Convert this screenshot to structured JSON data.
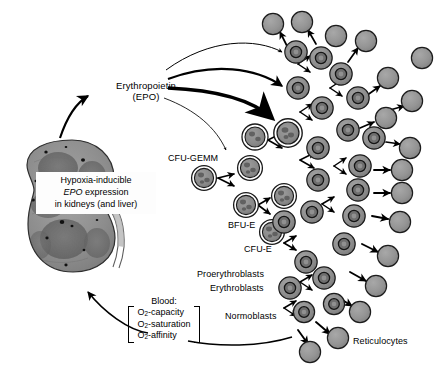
{
  "figure": {
    "labels": {
      "epo_line1": "Erythropoietin",
      "epo_line2": "(EPO)",
      "cfu_gemm": "CFU-GEMM",
      "bfu_e": "BFU-E",
      "cfu_e": "CFU-E",
      "proerythroblasts": "Proerythroblasts",
      "erythroblasts": "Erythroblasts",
      "normoblasts": "Normoblasts",
      "reticulocytes": "Reticulocytes"
    },
    "kidney_box": {
      "line1": "Hypoxia-inducible",
      "line2_italic": "EPO",
      "line2_rest": " expression",
      "line3": "in kidneys (and liver)"
    },
    "blood_box": {
      "title": "Blood:",
      "item1_pre": "O",
      "item1_sub": "2",
      "item1_post": "-capacity",
      "item2_pre": "O",
      "item2_sub": "2",
      "item2_post": "-saturation",
      "item3_pre": "O",
      "item3_sub": "2",
      "item3_post": "-affinity"
    },
    "colors": {
      "background": "#ffffff",
      "ink": "#000000",
      "cell_cytoplasm": "#8e8e8e",
      "cell_cytoplasm_light": "#9a9a9a",
      "cell_nucleus": "#6a6a6a",
      "reticulocyte": "#949494",
      "progenitor_fill": "#8a8a8a",
      "kidney_cortex": "#8a8a8a",
      "kidney_medulla": "#6f6f6f",
      "kidney_outline": "#3a3a3a"
    },
    "arrows": {
      "epo_to_cells": [
        {
          "name": "epo-arrow-thin-top",
          "weight": "thin"
        },
        {
          "name": "epo-arrow-medium",
          "weight": "medium"
        },
        {
          "name": "epo-arrow-bold",
          "weight": "bold"
        },
        {
          "name": "epo-arrow-thin-bottom",
          "weight": "thin"
        }
      ],
      "feedback_up": "kidney-epo-arrow",
      "feedback_blood": "blood-to-kidney-arrow",
      "cells_to_blood": "cells-to-blood-arrow"
    }
  }
}
